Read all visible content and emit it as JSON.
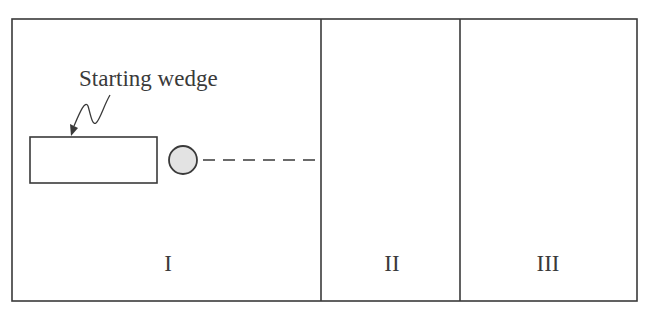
{
  "diagram": {
    "callout_label": "Starting wedge",
    "regions": [
      {
        "id": "region-1",
        "label": "I"
      },
      {
        "id": "region-2",
        "label": "II"
      },
      {
        "id": "region-3",
        "label": "III"
      }
    ],
    "colors": {
      "stroke": "#3a3a3a",
      "ball_fill": "#e3e3e3",
      "background": "#ffffff"
    }
  }
}
